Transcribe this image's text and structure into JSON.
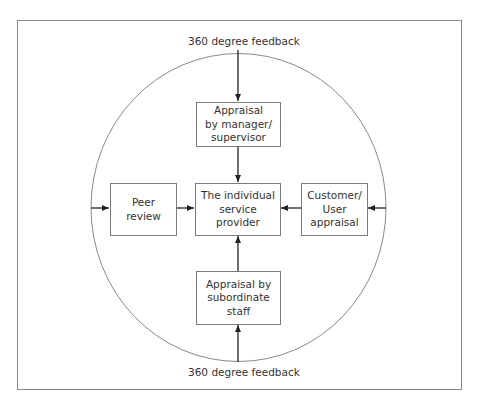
{
  "diagram": {
    "title_top": "360 degree feedback",
    "title_bottom": "360 degree feedback",
    "center": {
      "lines": [
        "The individual",
        "service",
        "provider"
      ]
    },
    "top": {
      "lines": [
        "Appraisal",
        "by manager/",
        "supervisor"
      ]
    },
    "left": {
      "lines": [
        "Peer",
        "review"
      ]
    },
    "right": {
      "lines": [
        "Customer/",
        "User",
        "appraisal"
      ]
    },
    "bottom": {
      "lines": [
        "Appraisal by",
        "subordinate",
        "staff"
      ]
    },
    "colors": {
      "frame": "#8a8a8a",
      "circle": "#8a8a8a",
      "box_border": "#7a7a7a",
      "arrow": "#222222",
      "text": "#333333"
    }
  }
}
